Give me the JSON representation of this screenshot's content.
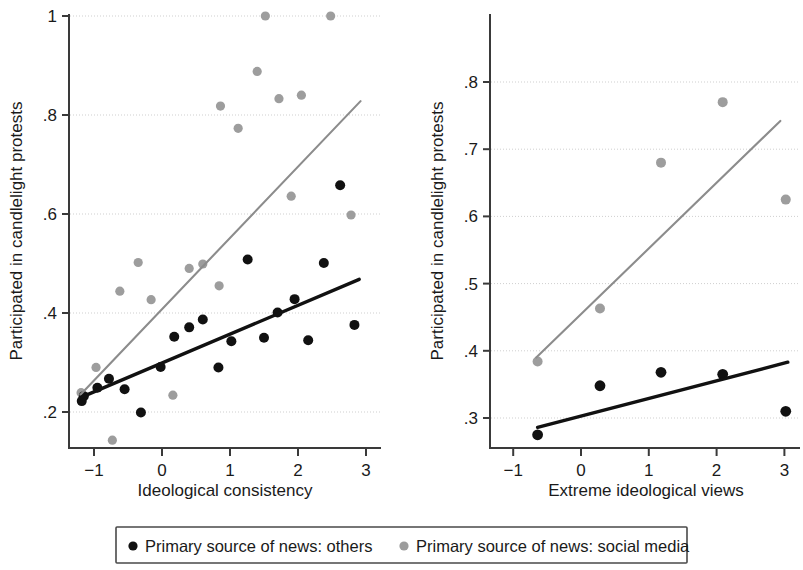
{
  "figure": {
    "background": "#ffffff",
    "series_colors": {
      "others": "#111111",
      "social_media": "#9d9d9d"
    }
  },
  "legend": {
    "position": "bottom",
    "items": [
      {
        "marker": "dot-black-icon",
        "label": "Primary source of news: others",
        "color": "#111111"
      },
      {
        "marker": "dot-gray-icon",
        "label": "Primary source of news: social media",
        "color": "#9d9d9d"
      }
    ]
  },
  "chart_data": [
    {
      "type": "scatter",
      "panel": "left",
      "title": "",
      "xlabel": "Ideological consistency",
      "ylabel": "Participated in candlelight protests",
      "xlim": [
        -1.35,
        3.2
      ],
      "ylim": [
        0.11,
        1.03
      ],
      "xticks": [
        -1,
        0,
        1,
        2,
        3
      ],
      "xticklabels": [
        "−1",
        "0",
        "1",
        "2",
        "3"
      ],
      "yticks": [
        0.2,
        0.4,
        0.6,
        0.8,
        1
      ],
      "yticklabels": [
        ".2",
        ".4",
        ".6",
        ".8",
        "1"
      ],
      "grid": true,
      "legend_position": "bottom",
      "series": [
        {
          "name": "Primary source of news: others",
          "color": "#111111",
          "marker": "circle",
          "points": [
            [
              -1.18,
              0.222
            ],
            [
              -1.15,
              0.232
            ],
            [
              -0.95,
              0.249
            ],
            [
              -0.78,
              0.267
            ],
            [
              -0.55,
              0.246
            ],
            [
              -0.31,
              0.199
            ],
            [
              -0.02,
              0.291
            ],
            [
              0.18,
              0.352
            ],
            [
              0.4,
              0.371
            ],
            [
              0.6,
              0.387
            ],
            [
              0.83,
              0.29
            ],
            [
              1.02,
              0.343
            ],
            [
              1.26,
              0.508
            ],
            [
              1.5,
              0.35
            ],
            [
              1.7,
              0.401
            ],
            [
              1.95,
              0.428
            ],
            [
              2.15,
              0.345
            ],
            [
              2.38,
              0.501
            ],
            [
              2.62,
              0.658
            ],
            [
              2.83,
              0.376
            ]
          ],
          "fit_line": {
            "x0": -1.2,
            "y0": 0.229,
            "x1": 2.9,
            "y1": 0.468
          }
        },
        {
          "name": "Primary source of news: social media",
          "color": "#9d9d9d",
          "marker": "circle",
          "points": [
            [
              -1.19,
              0.239
            ],
            [
              -0.97,
              0.29
            ],
            [
              -0.73,
              0.143
            ],
            [
              -0.62,
              0.444
            ],
            [
              -0.35,
              0.502
            ],
            [
              -0.16,
              0.427
            ],
            [
              0.16,
              0.234
            ],
            [
              0.4,
              0.49
            ],
            [
              0.6,
              0.499
            ],
            [
              0.84,
              0.455
            ],
            [
              0.86,
              0.818
            ],
            [
              1.12,
              0.773
            ],
            [
              1.4,
              0.888
            ],
            [
              1.52,
              1.0
            ],
            [
              1.72,
              0.833
            ],
            [
              1.9,
              0.636
            ],
            [
              2.05,
              0.84
            ],
            [
              2.48,
              1.0
            ],
            [
              2.78,
              0.598
            ]
          ],
          "fit_line": {
            "x0": -1.2,
            "y0": 0.235,
            "x1": 2.92,
            "y1": 0.828
          }
        }
      ]
    },
    {
      "type": "scatter",
      "panel": "right",
      "title": "",
      "xlabel": "Extreme ideological views",
      "ylabel": "Participated in candlelight protests",
      "xlim": [
        -1.35,
        3.2
      ],
      "ylim": [
        0.255,
        0.805
      ],
      "xticks": [
        -1,
        0,
        1,
        2,
        3
      ],
      "xticklabels": [
        "−1",
        "0",
        "1",
        "2",
        "3"
      ],
      "yticks": [
        0.3,
        0.4,
        0.5,
        0.6,
        0.7,
        0.8
      ],
      "yticklabels": [
        ".3",
        ".4",
        ".5",
        ".6",
        ".7",
        ".8"
      ],
      "grid": true,
      "legend_position": "bottom",
      "series": [
        {
          "name": "Primary source of news: others",
          "color": "#111111",
          "marker": "circle",
          "points": [
            [
              -0.64,
              0.275
            ],
            [
              0.28,
              0.348
            ],
            [
              1.18,
              0.368
            ],
            [
              2.09,
              0.365
            ],
            [
              3.02,
              0.31
            ]
          ],
          "fit_line": {
            "x0": -0.64,
            "y0": 0.286,
            "x1": 3.05,
            "y1": 0.383
          }
        },
        {
          "name": "Primary source of news: social media",
          "color": "#9d9d9d",
          "marker": "circle",
          "points": [
            [
              -0.64,
              0.384
            ],
            [
              0.28,
              0.463
            ],
            [
              1.18,
              0.68
            ],
            [
              2.09,
              0.77
            ],
            [
              3.02,
              0.625
            ]
          ],
          "fit_line": {
            "x0": -0.66,
            "y0": 0.39,
            "x1": 2.94,
            "y1": 0.742
          }
        }
      ]
    }
  ]
}
